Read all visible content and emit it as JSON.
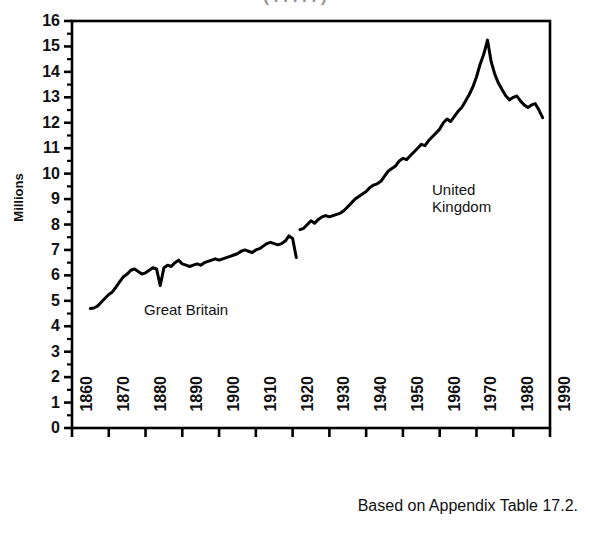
{
  "title_partial": "( . . . . . )",
  "caption": "Based on Appendix Table 17.2.",
  "annotations": {
    "great_britain": "Great Britain",
    "united_kingdom_line1": "United",
    "united_kingdom_line2": "Kingdom"
  },
  "chart_data": {
    "type": "line",
    "title": "",
    "xlabel": "",
    "ylabel": "Millions",
    "xlim": [
      1860,
      1990
    ],
    "ylim": [
      0,
      16
    ],
    "grid": false,
    "legend": "none",
    "x_ticks": [
      1860,
      1870,
      1880,
      1890,
      1900,
      1910,
      1920,
      1930,
      1940,
      1950,
      1960,
      1970,
      1980,
      1990
    ],
    "y_ticks": [
      0,
      1,
      2,
      3,
      4,
      5,
      6,
      7,
      8,
      9,
      10,
      11,
      12,
      13,
      14,
      15,
      16
    ],
    "y_minor_ticks": true,
    "line_color": "#000000",
    "line_width": 3,
    "series": [
      {
        "name": "Great Britain",
        "x": [
          1865,
          1866,
          1867,
          1868,
          1869,
          1870,
          1871,
          1872,
          1873,
          1874,
          1875,
          1876,
          1877,
          1878,
          1879,
          1880,
          1881,
          1882,
          1883,
          1884,
          1885,
          1886,
          1887,
          1888,
          1889,
          1890,
          1891,
          1892,
          1893,
          1894,
          1895,
          1896,
          1897,
          1898,
          1899,
          1900,
          1901,
          1902,
          1903,
          1904,
          1905,
          1906,
          1907,
          1908,
          1909,
          1910,
          1911,
          1912,
          1913,
          1914,
          1915,
          1916,
          1917,
          1918,
          1919,
          1920,
          1921
        ],
        "values": [
          4.7,
          4.72,
          4.8,
          4.95,
          5.1,
          5.25,
          5.35,
          5.55,
          5.75,
          5.95,
          6.05,
          6.2,
          6.25,
          6.15,
          6.05,
          6.1,
          6.2,
          6.3,
          6.25,
          5.6,
          6.3,
          6.4,
          6.35,
          6.5,
          6.6,
          6.45,
          6.4,
          6.35,
          6.4,
          6.45,
          6.4,
          6.5,
          6.55,
          6.6,
          6.65,
          6.6,
          6.65,
          6.7,
          6.75,
          6.8,
          6.85,
          6.95,
          7.0,
          6.95,
          6.9,
          7.0,
          7.05,
          7.15,
          7.25,
          7.3,
          7.25,
          7.2,
          7.25,
          7.35,
          7.55,
          7.45,
          6.7
        ]
      },
      {
        "name": "United Kingdom",
        "x": [
          1922,
          1923,
          1924,
          1925,
          1926,
          1927,
          1928,
          1929,
          1930,
          1931,
          1932,
          1933,
          1934,
          1935,
          1936,
          1937,
          1938,
          1939,
          1940,
          1941,
          1942,
          1943,
          1944,
          1945,
          1946,
          1947,
          1948,
          1949,
          1950,
          1951,
          1952,
          1953,
          1954,
          1955,
          1956,
          1957,
          1958,
          1959,
          1960,
          1961,
          1962,
          1963,
          1964,
          1965,
          1966,
          1967,
          1968,
          1969,
          1970,
          1971,
          1972,
          1973,
          1974,
          1975,
          1976,
          1977,
          1978,
          1979,
          1980,
          1981,
          1982,
          1983,
          1984,
          1985,
          1986,
          1987,
          1988
        ],
        "values": [
          7.8,
          7.85,
          8.0,
          8.15,
          8.05,
          8.2,
          8.3,
          8.35,
          8.3,
          8.35,
          8.4,
          8.45,
          8.55,
          8.7,
          8.85,
          9.0,
          9.1,
          9.2,
          9.3,
          9.45,
          9.55,
          9.6,
          9.7,
          9.9,
          10.1,
          10.2,
          10.3,
          10.5,
          10.6,
          10.55,
          10.7,
          10.85,
          11.0,
          11.15,
          11.1,
          11.3,
          11.45,
          11.6,
          11.75,
          12.0,
          12.15,
          12.05,
          12.25,
          12.45,
          12.6,
          12.85,
          13.1,
          13.4,
          13.8,
          14.3,
          14.7,
          15.25,
          14.4,
          13.9,
          13.55,
          13.3,
          13.05,
          12.9,
          13.0,
          13.05,
          12.85,
          12.7,
          12.6,
          12.7,
          12.75,
          12.5,
          12.2
        ]
      }
    ]
  }
}
